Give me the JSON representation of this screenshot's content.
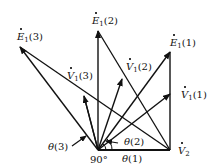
{
  "diagram": {
    "title": "",
    "origin_label": "90°",
    "nodes": [
      {
        "id": "E1_3",
        "symbol": "E",
        "sub": "1",
        "arg": "(3)"
      },
      {
        "id": "E1_2",
        "symbol": "E",
        "sub": "1",
        "arg": "(2)"
      },
      {
        "id": "E1_1",
        "symbol": "E",
        "sub": "1",
        "arg": "(1)"
      },
      {
        "id": "V1_3",
        "symbol": "V",
        "sub": "1",
        "arg": "(3)"
      },
      {
        "id": "V1_2",
        "symbol": "V",
        "sub": "1",
        "arg": "(2)"
      },
      {
        "id": "V1_1",
        "symbol": "V",
        "sub": "1",
        "arg": "(1)"
      },
      {
        "id": "V2",
        "symbol": "V",
        "sub": "2",
        "arg": ""
      }
    ],
    "angles": [
      {
        "id": "theta3",
        "symbol": "θ",
        "arg": "(3)"
      },
      {
        "id": "theta2",
        "symbol": "θ",
        "arg": "(2)"
      },
      {
        "id": "theta1",
        "symbol": "θ",
        "arg": "(1)"
      }
    ],
    "colors": {
      "stroke": "#111111",
      "background": "#ffffff"
    }
  }
}
